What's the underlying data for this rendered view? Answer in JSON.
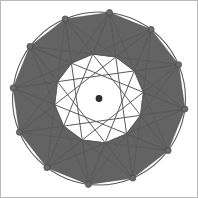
{
  "figure": {
    "background_color": "#ffffff",
    "frame_color": "#b9b9b9"
  },
  "chart_data": {
    "type": "scatter",
    "xlabel": "",
    "ylabel": "",
    "grid": false,
    "legend_position": "none",
    "center": {
      "x": 99,
      "y": 98.5,
      "label": "center-point"
    },
    "circle": {
      "cx": 99,
      "cy": 98.5,
      "r": 86.5,
      "stroke": "#5a5a5a",
      "stroke_width": 1.1,
      "fill": "none"
    },
    "vertex_count": 12,
    "vertex_radius": 86.5,
    "vertex_start_angle_deg": -83,
    "vertex_angle_step_deg": 30,
    "vertex_marker_radius": 3.0,
    "vertex_marker_fill": "#6b6b6b",
    "vertex_marker_stroke": "#4a4a4a",
    "chord_skip_a": 5,
    "chord_skip_b": 4,
    "chord_stroke": "#5a5a5a",
    "chord_stroke_width": 1.0,
    "triangle_fill": "#636363",
    "triangle_stroke": "#4f4f4f",
    "triangle_stroke_width": 0.6,
    "center_dot": {
      "r": 3.4,
      "fill": "#2e2e2e"
    },
    "categories": [
      "v0",
      "v1",
      "v2",
      "v3",
      "v4",
      "v5",
      "v6",
      "v7",
      "v8",
      "v9",
      "v10",
      "v11"
    ],
    "angles_deg": [
      -83,
      -53,
      -23,
      7,
      37,
      67,
      97,
      127,
      157,
      187,
      217,
      247
    ],
    "x": [
      109.5,
      151.1,
      178.6,
      184.9,
      168.1,
      132.8,
      88.4,
      46.9,
      19.4,
      13.1,
      29.9,
      65.2
    ],
    "y": [
      12.6,
      29.4,
      64.7,
      109.1,
      150.6,
      178.1,
      184.4,
      167.6,
      132.3,
      87.9,
      46.4,
      18.9
    ],
    "xlim": [
      0,
      198
    ],
    "ylim": [
      0,
      198
    ]
  }
}
